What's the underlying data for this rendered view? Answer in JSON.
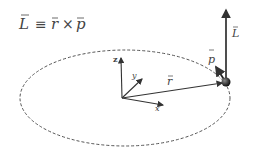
{
  "title_equation": {
    "L": "L",
    "equiv": "≡",
    "r": "r",
    "times": "×",
    "p": "p"
  },
  "labels": {
    "L": "L",
    "p": "p",
    "r": "r",
    "z": "z",
    "y": "y",
    "x": "x"
  },
  "colors": {
    "ink": "#333333",
    "orbit": "#555555",
    "ball": "#222222"
  }
}
